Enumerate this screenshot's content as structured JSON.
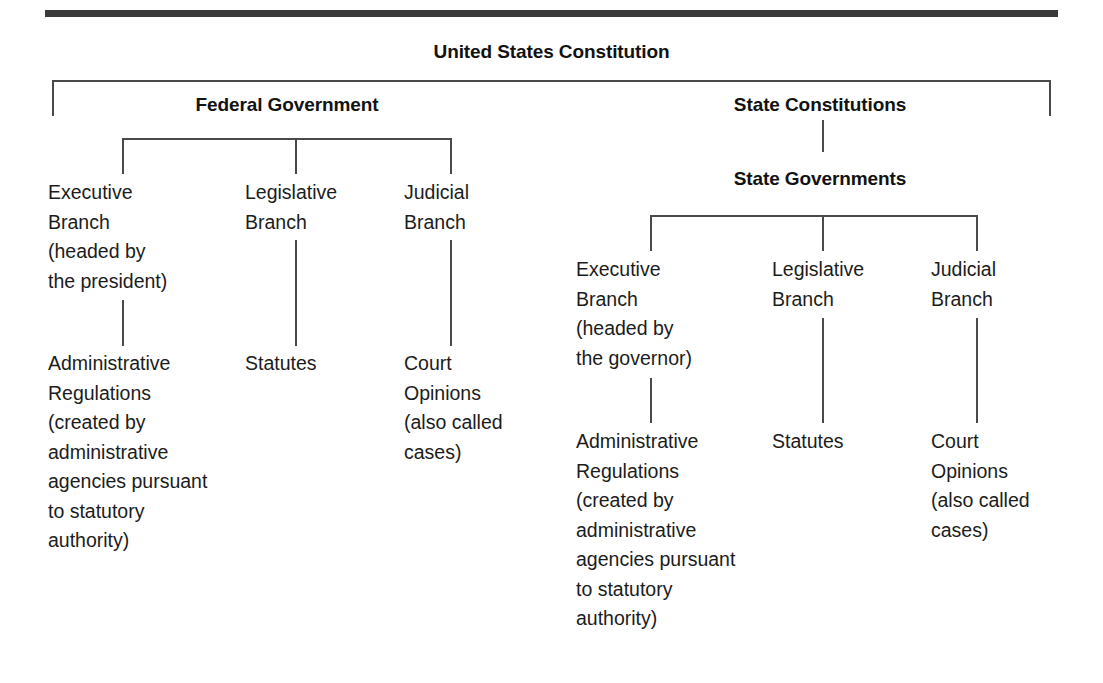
{
  "figure": {
    "title": "United States Constitution",
    "branches": {
      "federal_heading": "Federal Government",
      "state_constitutions_heading": "State Constitutions",
      "state_governments_heading": "State Governments"
    }
  },
  "federal": {
    "executive": {
      "branch_label": "Executive\nBranch\n(headed by\nthe president)",
      "output_label": "Administrative\nRegulations\n(created by\nadministrative\nagencies pursuant\nto statutory\nauthority)"
    },
    "legislative": {
      "branch_label": "Legislative\nBranch",
      "output_label": "Statutes"
    },
    "judicial": {
      "branch_label": "Judicial\nBranch",
      "output_label": "Court\nOpinions\n(also called\ncases)"
    }
  },
  "state": {
    "executive": {
      "branch_label": "Executive\nBranch\n(headed by\nthe governor)",
      "output_label": "Administrative\nRegulations\n(created by\nadministrative\nagencies pursuant\nto statutory\nauthority)"
    },
    "legislative": {
      "branch_label": "Legislative\nBranch",
      "output_label": "Statutes"
    },
    "judicial": {
      "branch_label": "Judicial\nBranch",
      "output_label": "Court\nOpinions\n(also called\ncases)"
    }
  },
  "colors": {
    "rule": "#3a3a3a",
    "connector": "#4a4a4a",
    "text": "#1c1c1c",
    "background": "#ffffff"
  }
}
